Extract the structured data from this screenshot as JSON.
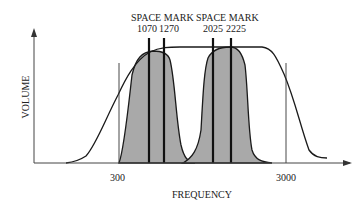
{
  "diagram": {
    "type": "frequency-response",
    "x_axis_label": "FREQUENCY",
    "y_axis_label": "VOLUME",
    "x_ticks": [
      "300",
      "3000"
    ],
    "channels": [
      {
        "title": "SPACE MARK",
        "space": "1070",
        "mark": "1270"
      },
      {
        "title": "SPACE MARK",
        "space": "2025",
        "mark": "2225"
      }
    ],
    "colors": {
      "fill": "#a9a9a9",
      "line": "#1a1a1a"
    }
  }
}
